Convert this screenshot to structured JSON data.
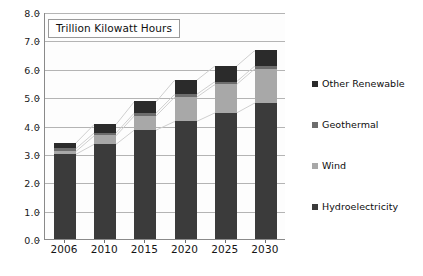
{
  "chart_data": {
    "type": "bar",
    "stacked": true,
    "title": "Trillion Kilowatt Hours",
    "xlabel": "",
    "ylabel": "",
    "ylim": [
      0.0,
      8.0
    ],
    "ytick_step": 1.0,
    "grid": true,
    "legend_position": "right",
    "categories": [
      "2006",
      "2010",
      "2015",
      "2020",
      "2025",
      "2030"
    ],
    "ytick_labels": [
      "0.0",
      "1.0",
      "2.0",
      "3.0",
      "4.0",
      "5.0",
      "6.0",
      "7.0",
      "8.0"
    ],
    "series": [
      {
        "name": "Hydroelectricity",
        "color": "#3b3b3b",
        "values": [
          3.0,
          3.35,
          3.85,
          4.15,
          4.45,
          4.8
        ]
      },
      {
        "name": "Wind",
        "color": "#a8a8a8",
        "values": [
          0.1,
          0.3,
          0.5,
          0.85,
          1.0,
          1.2
        ]
      },
      {
        "name": "Geothermal",
        "color": "#6d6d6d",
        "values": [
          0.1,
          0.1,
          0.1,
          0.1,
          0.1,
          0.1
        ]
      },
      {
        "name": "Other Renewable",
        "color": "#2b2b2b",
        "values": [
          0.2,
          0.3,
          0.4,
          0.5,
          0.55,
          0.55
        ]
      }
    ],
    "totals": [
      3.4,
      4.05,
      4.85,
      5.6,
      6.1,
      6.65
    ],
    "legend_order": [
      "Other Renewable",
      "Geothermal",
      "Wind",
      "Hydroelectricity"
    ],
    "connector_lines": true
  }
}
